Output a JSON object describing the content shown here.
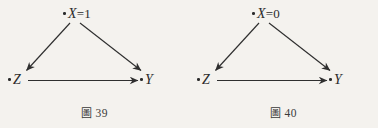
{
  "page": {
    "background_color": "#f4f2ee",
    "ink_color": "#2b2b2b"
  },
  "figures": [
    {
      "id": "figure-39",
      "caption_label": "圖",
      "caption_number": "39",
      "caption_text": "圖 39",
      "nodes": [
        {
          "id": "apex",
          "variable": "X",
          "value": "=1",
          "label": "X=1"
        },
        {
          "id": "z",
          "variable": "Z",
          "value": "",
          "label": "Z"
        },
        {
          "id": "y",
          "variable": "Y",
          "value": "",
          "label": "Y"
        }
      ],
      "edges": [
        {
          "from": "X",
          "to": "Z",
          "label": "X→Z"
        },
        {
          "from": "X",
          "to": "Y",
          "label": "X→Y"
        },
        {
          "from": "Z",
          "to": "Y",
          "label": "Z→Y"
        }
      ]
    },
    {
      "id": "figure-40",
      "caption_label": "圖",
      "caption_number": "40",
      "caption_text": "圖 40",
      "nodes": [
        {
          "id": "apex",
          "variable": "X",
          "value": "=0",
          "label": "X=0"
        },
        {
          "id": "z",
          "variable": "Z",
          "value": "",
          "label": "Z"
        },
        {
          "id": "y",
          "variable": "Y",
          "value": "",
          "label": "Y"
        }
      ],
      "edges": [
        {
          "from": "X",
          "to": "Z",
          "label": "X→Z"
        },
        {
          "from": "X",
          "to": "Y",
          "label": "X→Y"
        },
        {
          "from": "Z",
          "to": "Y",
          "label": "Z→Y"
        }
      ]
    }
  ]
}
